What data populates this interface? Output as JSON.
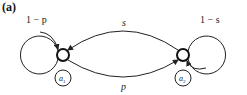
{
  "panel_label": "(a)",
  "nodes": [
    {
      "id": "n1",
      "label_base": "a",
      "label_sub": "1"
    },
    {
      "id": "n2",
      "label_base": "a",
      "label_sub": "2"
    }
  ],
  "edges": {
    "self_loop_1": {
      "from": "n1",
      "to": "n1",
      "label": "1 − p"
    },
    "self_loop_2": {
      "from": "n2",
      "to": "n2",
      "label": "1 − s"
    },
    "top_arc": {
      "from": "n2",
      "to": "n1",
      "label": "s"
    },
    "bottom_arc": {
      "from": "n1",
      "to": "n2",
      "label": "p"
    }
  },
  "colors": {
    "stroke": "#222222",
    "background": "#ffffff"
  }
}
